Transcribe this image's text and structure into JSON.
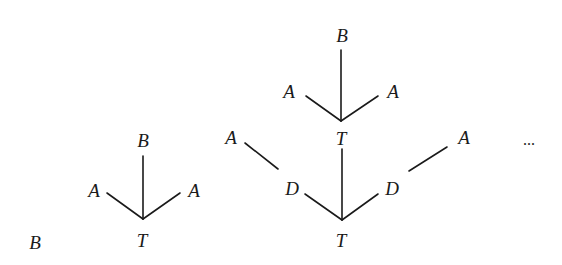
{
  "figure": {
    "ellipsis": "...",
    "trees": [
      {
        "id": "tree0",
        "nodes": [
          {
            "id": "b0",
            "label": "B",
            "x": 35,
            "y": 242
          }
        ],
        "edges": []
      },
      {
        "id": "tree1",
        "nodes": [
          {
            "id": "t1",
            "label": "T",
            "x": 142,
            "y": 240
          },
          {
            "id": "b1",
            "label": "B",
            "x": 143,
            "y": 140
          },
          {
            "id": "a1l",
            "label": "A",
            "x": 94,
            "y": 190
          },
          {
            "id": "a1r",
            "label": "A",
            "x": 194,
            "y": 190
          }
        ],
        "edges": [
          {
            "from": "t1",
            "to": "b1",
            "x1": 143,
            "y1": 219,
            "x2": 143,
            "y2": 156
          },
          {
            "from": "t1",
            "to": "a1l",
            "x1": 143,
            "y1": 219,
            "x2": 107,
            "y2": 193
          },
          {
            "from": "t1",
            "to": "a1r",
            "x1": 143,
            "y1": 219,
            "x2": 180,
            "y2": 193
          }
        ]
      },
      {
        "id": "tree2",
        "nodes": [
          {
            "id": "t2b",
            "label": "T",
            "x": 341,
            "y": 240
          },
          {
            "id": "d2l",
            "label": "D",
            "x": 292,
            "y": 188
          },
          {
            "id": "d2r",
            "label": "D",
            "x": 392,
            "y": 188
          },
          {
            "id": "a2fl",
            "label": "A",
            "x": 231,
            "y": 137
          },
          {
            "id": "a2fr",
            "label": "A",
            "x": 464,
            "y": 137
          },
          {
            "id": "t2m",
            "label": "T",
            "x": 341,
            "y": 138
          },
          {
            "id": "a2l",
            "label": "A",
            "x": 289,
            "y": 91
          },
          {
            "id": "a2r",
            "label": "A",
            "x": 393,
            "y": 91
          },
          {
            "id": "b2",
            "label": "B",
            "x": 342,
            "y": 35
          }
        ],
        "edges": [
          {
            "from": "t2b",
            "to": "t2m",
            "x1": 342,
            "y1": 220,
            "x2": 342,
            "y2": 149
          },
          {
            "from": "t2b",
            "to": "d2l",
            "x1": 342,
            "y1": 220,
            "x2": 305,
            "y2": 194
          },
          {
            "from": "t2b",
            "to": "d2r",
            "x1": 342,
            "y1": 220,
            "x2": 378,
            "y2": 194
          },
          {
            "from": "d2l",
            "to": "a2fl",
            "x1": 278,
            "y1": 169,
            "x2": 245,
            "y2": 143
          },
          {
            "from": "d2r",
            "to": "a2fr",
            "x1": 409,
            "y1": 171,
            "x2": 447,
            "y2": 147
          },
          {
            "from": "t2m",
            "to": "b2",
            "x1": 341,
            "y1": 121,
            "x2": 341,
            "y2": 50
          },
          {
            "from": "t2m",
            "to": "a2l",
            "x1": 341,
            "y1": 121,
            "x2": 306,
            "y2": 96
          },
          {
            "from": "t2m",
            "to": "a2r",
            "x1": 341,
            "y1": 121,
            "x2": 378,
            "y2": 96
          }
        ]
      }
    ],
    "ellipsis_pos": {
      "x": 529,
      "y": 140
    }
  }
}
